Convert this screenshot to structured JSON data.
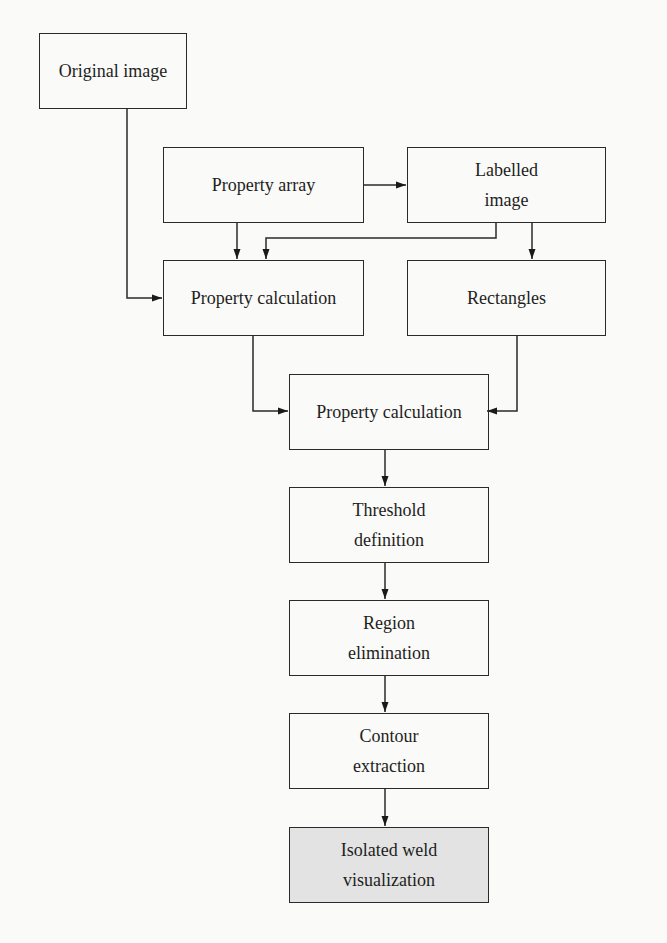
{
  "diagram": {
    "type": "flowchart",
    "colors": {
      "stroke": "#2a2a2a",
      "text": "#1e1e1e",
      "final_fill": "#e3e3e3",
      "background": "#fafaf8"
    },
    "nodes": [
      {
        "id": "original_image",
        "lines": [
          "Original image"
        ]
      },
      {
        "id": "property_array",
        "lines": [
          "Property array"
        ]
      },
      {
        "id": "labelled_image",
        "lines": [
          "Labelled",
          "image"
        ]
      },
      {
        "id": "property_calculation_1",
        "lines": [
          "Property calculation"
        ]
      },
      {
        "id": "rectangles",
        "lines": [
          "Rectangles"
        ]
      },
      {
        "id": "property_calculation_2",
        "lines": [
          "Property calculation"
        ]
      },
      {
        "id": "threshold_definition",
        "lines": [
          "Threshold",
          "definition"
        ]
      },
      {
        "id": "region_elimination",
        "lines": [
          "Region",
          "elimination"
        ]
      },
      {
        "id": "contour_extraction",
        "lines": [
          "Contour",
          "extraction"
        ]
      },
      {
        "id": "isolated_weld_visualization",
        "lines": [
          "Isolated weld",
          "visualization"
        ]
      }
    ],
    "edges": [
      {
        "from": "original_image",
        "to": "property_calculation_1"
      },
      {
        "from": "property_array",
        "to": "labelled_image"
      },
      {
        "from": "property_array",
        "to": "property_calculation_1"
      },
      {
        "from": "labelled_image",
        "to": "property_calculation_1"
      },
      {
        "from": "labelled_image",
        "to": "rectangles"
      },
      {
        "from": "property_calculation_1",
        "to": "property_calculation_2"
      },
      {
        "from": "rectangles",
        "to": "property_calculation_2"
      },
      {
        "from": "property_calculation_2",
        "to": "threshold_definition"
      },
      {
        "from": "threshold_definition",
        "to": "region_elimination"
      },
      {
        "from": "region_elimination",
        "to": "contour_extraction"
      },
      {
        "from": "contour_extraction",
        "to": "isolated_weld_visualization"
      }
    ]
  }
}
